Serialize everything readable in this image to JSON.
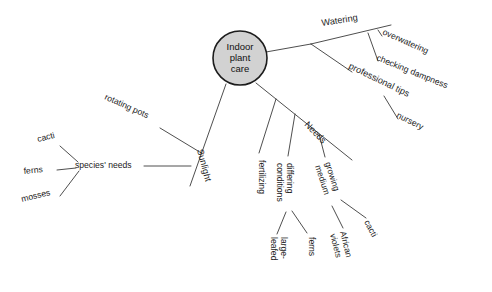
{
  "diagram": {
    "type": "mind-map",
    "background_color": "#ffffff",
    "line_color": "#3a3a3a",
    "text_color": "#1d1d1d",
    "root": {
      "label": "Indoor plant care",
      "label_lines": [
        "Indoor",
        "plant",
        "care"
      ],
      "shape": "circle",
      "fill_color": "#d2d2d2",
      "stroke_color": "#1c1c1c",
      "cx": 240,
      "cy": 58,
      "r": 27
    },
    "branches": [
      {
        "id": "watering",
        "label": "Watering",
        "x": 322,
        "y": 26,
        "rotate": -9,
        "anchor": "start",
        "font_size": 9.4,
        "children": [
          {
            "id": "overwatering",
            "label": "overwatering",
            "x": 382,
            "y": 34,
            "rotate": 24,
            "font_size": 8.8
          },
          {
            "id": "checking-dampness",
            "label": "checking dampness",
            "x": 376,
            "y": 60,
            "rotate": 22,
            "font_size": 8.8
          }
        ]
      },
      {
        "id": "professional-tips",
        "label": "professional tips",
        "x": 348,
        "y": 68,
        "rotate": 26,
        "anchor": "start",
        "font_size": 9.0,
        "children": [
          {
            "id": "nursery",
            "label": "nursery",
            "x": 396,
            "y": 117,
            "rotate": 27,
            "font_size": 8.8
          }
        ]
      },
      {
        "id": "sunlight",
        "label": "Sunlight",
        "x": 197,
        "y": 150,
        "rotate": 75,
        "anchor": "start",
        "font_size": 9.4,
        "children": [
          {
            "id": "rotating-pots",
            "label": "rotating pots",
            "x": 104,
            "y": 99,
            "rotate": 24,
            "font_size": 8.8
          },
          {
            "id": "species-needs",
            "label": "species' needs",
            "x": 75,
            "y": 168,
            "rotate": 0,
            "font_size": 9.2
          }
        ]
      },
      {
        "id": "needs",
        "label": "Needs",
        "x": 304,
        "y": 125,
        "rotate": 46,
        "anchor": "start",
        "font_size": 9.4,
        "children": [
          {
            "id": "fertilizing",
            "label": "fertilizing",
            "x": 259,
            "y": 160,
            "rotate": 90,
            "font_size": 8.8
          },
          {
            "id": "differing-conditions",
            "label": "differing conditions",
            "lines": [
              "differing",
              "conditions"
            ],
            "x": 287,
            "y": 163,
            "rotate": 90,
            "font_size": 8.8
          },
          {
            "id": "growing-medium",
            "label": "growing medium",
            "lines": [
              "growing",
              "medium"
            ],
            "x": 325,
            "y": 163,
            "rotate": 72,
            "font_size": 8.8
          }
        ]
      }
    ],
    "leaves": [
      {
        "id": "cacti-species",
        "label": "cacti",
        "x": 38,
        "y": 142,
        "rotate": -14,
        "font_size": 8.8
      },
      {
        "id": "ferns-species",
        "label": "ferns",
        "x": 24,
        "y": 174,
        "rotate": -6,
        "font_size": 8.8
      },
      {
        "id": "mosses-species",
        "label": "mosses",
        "x": 22,
        "y": 202,
        "rotate": -14,
        "font_size": 8.8
      },
      {
        "id": "large-leafed",
        "label": "large-leafed",
        "lines": [
          "large-",
          "leafed"
        ],
        "x": 281,
        "y": 237,
        "rotate": 90,
        "font_size": 8.6
      },
      {
        "id": "ferns-conditions",
        "label": "ferns",
        "x": 309,
        "y": 237,
        "rotate": 90,
        "font_size": 8.6
      },
      {
        "id": "african-violets",
        "label": "African violets",
        "lines": [
          "African",
          "violets"
        ],
        "x": 340,
        "y": 232,
        "rotate": 76,
        "font_size": 8.6
      },
      {
        "id": "cacti-medium",
        "label": "cacti",
        "x": 364,
        "y": 222,
        "rotate": 62,
        "font_size": 8.6
      }
    ],
    "edges": [
      {
        "id": "edge-root-watering",
        "from": "root",
        "to": "watering-hub",
        "d": "M 266 52 L 311 44"
      },
      {
        "id": "edge-watering-spine",
        "from": "watering-hub",
        "to": "watering-end",
        "d": "M 311 44 L 391 25"
      },
      {
        "id": "edge-watering-overwatering",
        "from": "watering-spine",
        "to": "overwatering",
        "d": "M 378 30 L 382 36"
      },
      {
        "id": "edge-watering-checking",
        "from": "watering-spine",
        "to": "checking-dampness",
        "d": "M 368 33 L 378 61"
      },
      {
        "id": "edge-root-proftips",
        "from": "watering-hub",
        "to": "professional-tips",
        "d": "M 311 44 L 352 72"
      },
      {
        "id": "edge-proftips-nursery",
        "from": "professional-tips",
        "to": "nursery",
        "d": "M 384 96 L 398 119"
      },
      {
        "id": "edge-root-sunlight",
        "from": "root",
        "to": "sunlight-end",
        "d": "M 226 84 L 190 186"
      },
      {
        "id": "edge-sunlight-rotating",
        "from": "rotating-pots",
        "to": "sunlight-spine",
        "d": "M 160 128 L 203 154"
      },
      {
        "id": "edge-sunlight-species",
        "from": "species-needs",
        "to": "sunlight-spine",
        "d": "M 144 166 L 191 166"
      },
      {
        "id": "edge-species-cacti",
        "from": "species-needs",
        "to": "cacti-species",
        "d": "M 78 162 L 60 146"
      },
      {
        "id": "edge-species-ferns",
        "from": "species-needs",
        "to": "ferns-species",
        "d": "M 76 168 L 57 170"
      },
      {
        "id": "edge-species-mosses",
        "from": "species-needs",
        "to": "mosses-species",
        "d": "M 79 171 L 60 196"
      },
      {
        "id": "edge-root-needs",
        "from": "root",
        "to": "needs-end",
        "d": "M 256 83 L 352 160"
      },
      {
        "id": "edge-needs-fertilizing",
        "from": "needs-spine",
        "to": "fertilizing",
        "d": "M 276 99 L 259 153"
      },
      {
        "id": "edge-needs-differing",
        "from": "needs-spine",
        "to": "differing-conditions",
        "d": "M 295 114 L 288 156"
      },
      {
        "id": "edge-needs-growing",
        "from": "needs-spine",
        "to": "growing-medium",
        "d": "M 319 134 L 325 157"
      },
      {
        "id": "edge-differing-large",
        "from": "differing-conditions",
        "to": "large-leafed",
        "d": "M 286 212 L 277 234"
      },
      {
        "id": "edge-differing-ferns",
        "from": "differing-conditions",
        "to": "ferns-conditions",
        "d": "M 292 211 L 307 233"
      },
      {
        "id": "edge-growing-african",
        "from": "growing-medium",
        "to": "african-violets",
        "d": "M 332 206 L 343 228"
      },
      {
        "id": "edge-growing-cacti",
        "from": "growing-medium",
        "to": "cacti-medium",
        "d": "M 341 200 L 366 218"
      }
    ]
  }
}
